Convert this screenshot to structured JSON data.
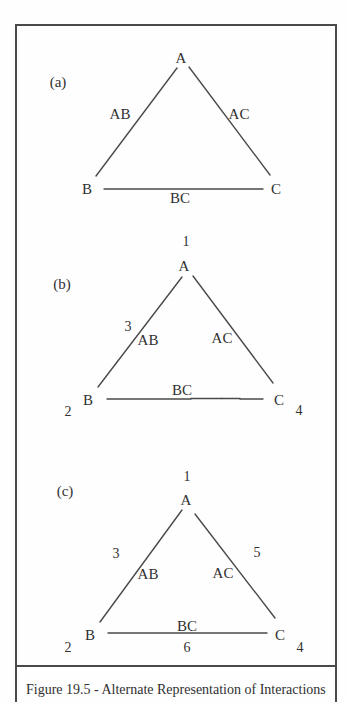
{
  "figure": {
    "caption": "Figure 19.5 - Alternate Representation of Interactions",
    "line_color": "#4a4a4a",
    "artifact": {
      "red": "#cc4a40",
      "green": "#52a562"
    },
    "panels": [
      {
        "tag": "(a)",
        "vertices": {
          "top": "A",
          "left": "B",
          "right": "C"
        },
        "edges": {
          "ab": "AB",
          "ac": "AC",
          "bc": "BC"
        }
      },
      {
        "tag": "(b)",
        "vertices": {
          "top": "A",
          "left": "B",
          "right": "C"
        },
        "edges": {
          "ab": "AB",
          "ac": "AC",
          "bc": "BC"
        },
        "numbers": {
          "top": "1",
          "left": "2",
          "right": "4",
          "ab": "3"
        }
      },
      {
        "tag": "(c)",
        "vertices": {
          "top": "A",
          "left": "B",
          "right": "C"
        },
        "edges": {
          "ab": "AB",
          "ac": "AC",
          "bc": "BC"
        },
        "numbers": {
          "top": "1",
          "left": "2",
          "right": "4",
          "ab": "3",
          "ac": "5",
          "bc": "6"
        }
      }
    ]
  }
}
